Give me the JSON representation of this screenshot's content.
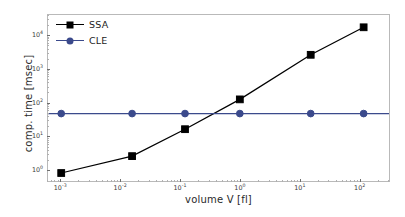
{
  "chart_data": {
    "type": "line",
    "title": "",
    "xlabel": "volume V [fl]",
    "ylabel": "comp. time [msec]",
    "xscale": "log",
    "yscale": "log",
    "xlim": [
      0.0006,
      320
    ],
    "ylim": [
      0.45,
      42000
    ],
    "grid": false,
    "legend_position": "upper left",
    "x_tick_labels": [
      "10⁻³",
      "10⁻²",
      "10⁻¹",
      "10⁰",
      "10¹",
      "10²"
    ],
    "x_tick_values": [
      0.001,
      0.01,
      0.1,
      1,
      10,
      100
    ],
    "y_tick_labels": [
      "10⁰",
      "10¹",
      "10²",
      "10³",
      "10⁴"
    ],
    "y_tick_values": [
      1,
      10,
      100,
      1000,
      10000
    ],
    "series": [
      {
        "name": "SSA",
        "color": "#000000",
        "marker": "square",
        "x": [
          0.001,
          0.0155,
          0.12,
          1.0,
          15.5,
          120
        ],
        "values": [
          0.78,
          2.5,
          16,
          125,
          2700,
          18000
        ]
      },
      {
        "name": "CLE",
        "color": "#3b4a8c",
        "marker": "circle",
        "x": [
          0.001,
          0.0155,
          0.12,
          1.0,
          15.5,
          120
        ],
        "values": [
          47,
          47,
          47,
          47,
          47,
          47
        ]
      }
    ]
  },
  "axes": {
    "x_title": "volume V [fl]",
    "y_title": "comp. time [msec]"
  },
  "legend": {
    "entries": [
      {
        "label": "SSA"
      },
      {
        "label": "CLE"
      }
    ]
  }
}
